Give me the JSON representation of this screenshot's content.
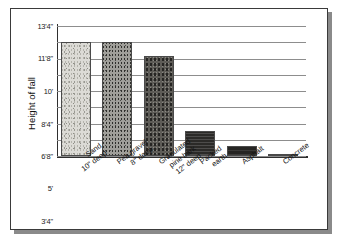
{
  "chart_data": {
    "type": "bar",
    "title": "",
    "subtitle": "",
    "xlabel": "",
    "ylabel": "Height of fall",
    "ylim": [
      0,
      13.333
    ],
    "grid": true,
    "legend": "none",
    "units": "feet and inches",
    "categories": [
      "Sand\n10\" deep",
      "Pea gravel\n8\" deep",
      "Granulated pine bark\n12\" deep",
      "Packed earth",
      "Asphalt",
      "Concrete"
    ],
    "category_lines": [
      [
        "Sand",
        "10\" deep"
      ],
      [
        "Pea gravel",
        "8\" deep"
      ],
      [
        "Granulated",
        "pine bark",
        "12\" deep"
      ],
      [
        "Packed",
        "earth"
      ],
      [
        "Asphalt"
      ],
      [
        "Concrete"
      ]
    ],
    "values": [
      11.667,
      11.667,
      10.25,
      2.583,
      1.0,
      0.25
    ],
    "value_labels": [
      "11'8\"",
      "11'8\"",
      "10'3\"",
      "2'7\"",
      "1'0\"",
      "0'3\""
    ],
    "ytick_values": [
      0,
      1.667,
      3.333,
      5,
      6.667,
      8.333,
      10,
      11.667,
      13.333
    ],
    "ytick_labels": [
      "0\"",
      "1'8\"",
      "3'4\"",
      "5'",
      "6'8\"",
      "8'4\"",
      "10'",
      "11'8\"",
      "13'4\""
    ],
    "bar_textures": [
      "sand",
      "pea-gravel",
      "pine-bark",
      "packed-earth",
      "asphalt",
      "concrete"
    ],
    "colors": {
      "sand": "#dcdbd6",
      "pea_gravel": "#9f9e99",
      "pine_bark": "#5e5c57",
      "packed_earth": "#2b2a28",
      "asphalt": "#262523",
      "concrete": "#d2d1cc",
      "gridline": "#8d8d8d",
      "axis": "#2f2f2f",
      "frame": "#3a3a3a",
      "shadow": "#8a8a8a",
      "background": "#ffffff",
      "text": "#141414"
    }
  },
  "axis": {
    "y_title": "Height of fall"
  }
}
